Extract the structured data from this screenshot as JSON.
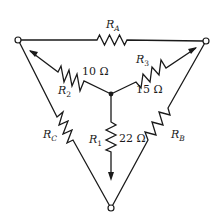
{
  "diagram": {
    "type": "delta-wye resistor network with potentiometer arrows",
    "terminals": [
      "left",
      "right",
      "bottom"
    ],
    "delta_resistors": {
      "RA": {
        "symbol": "R",
        "subscript": "A",
        "position": "top edge"
      },
      "RB": {
        "symbol": "R",
        "subscript": "B",
        "position": "right edge"
      },
      "RC": {
        "symbol": "R",
        "subscript": "C",
        "position": "left edge"
      }
    },
    "wye_resistors": {
      "R1": {
        "symbol": "R",
        "subscript": "1",
        "value": "22 Ω"
      },
      "R2": {
        "symbol": "R",
        "subscript": "2",
        "value": "10 Ω"
      },
      "R3": {
        "symbol": "R",
        "subscript": "3",
        "value": "15 Ω"
      }
    },
    "colors": {
      "line": "#1a1a1a",
      "background": "#ffffff"
    }
  }
}
